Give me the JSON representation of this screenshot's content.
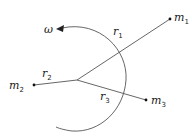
{
  "diagram": {
    "type": "rotating-masses",
    "colors": {
      "line": "#555555",
      "text": "#222222",
      "background": "#ffffff"
    },
    "rotation": {
      "symbol": "ω",
      "direction": "counterclockwise"
    },
    "masses": [
      {
        "name": "m",
        "sub": "1"
      },
      {
        "name": "m",
        "sub": "2"
      },
      {
        "name": "m",
        "sub": "3"
      }
    ],
    "radii": [
      {
        "name": "r",
        "sub": "1"
      },
      {
        "name": "r",
        "sub": "2"
      },
      {
        "name": "r",
        "sub": "3"
      }
    ]
  }
}
